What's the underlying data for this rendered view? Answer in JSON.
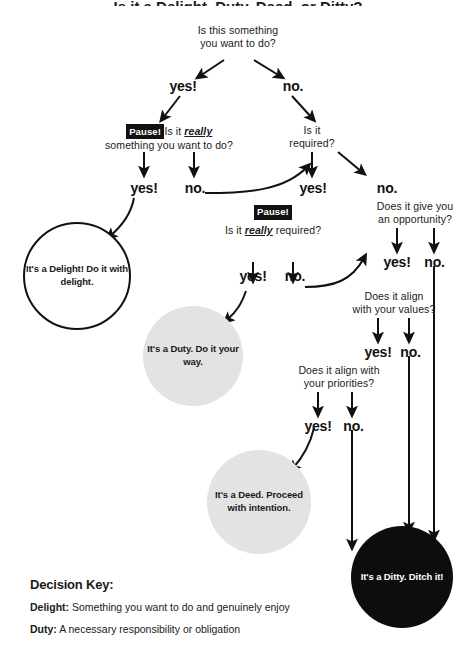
{
  "title_partial": "Is it a Delight, Duty, Deed, or Ditty?",
  "nodes": {
    "root_q": {
      "line1": "Is this something",
      "line2": "you want to do?"
    },
    "root_yes": "yes!",
    "root_no": "no.",
    "pause1_badge": "Pause!",
    "pause1_q_a": "Is it ",
    "pause1_q_em": "really",
    "pause1_line2": "something you want to do?",
    "l_yes": "yes!",
    "l_no": "no.",
    "required_q": {
      "line1": "Is it",
      "line2": "required?"
    },
    "req_yes": "yes!",
    "req_no": "no.",
    "pause2_badge": "Pause!",
    "pause2_q_a": "Is it ",
    "pause2_q_em": "really",
    "pause2_q_b": " required?",
    "m_yes": "yes!",
    "m_no": "no.",
    "opportunity_q": {
      "line1": "Does it give you",
      "line2": "an opportunity?"
    },
    "opp_yes": "yes!",
    "opp_no": "no.",
    "values_q": {
      "line1": "Does it align",
      "line2": "with your values?"
    },
    "val_yes": "yes!",
    "val_no": "no.",
    "priorities_q": {
      "line1": "Does it align with",
      "line2": "your priorities?"
    },
    "pri_yes": "yes!",
    "pri_no": "no."
  },
  "outcomes": {
    "delight": {
      "line1": "It's a Delight!",
      "line2": "Do it with",
      "line3": "delight."
    },
    "duty": {
      "line1": "It's a Duty.",
      "line2": "Do it",
      "line3": "your way."
    },
    "deed": {
      "line1": "It's a Deed.",
      "line2": "Proceed with",
      "line3": "intention."
    },
    "ditty": {
      "line1": "It's a Ditty.",
      "line2": "Ditch it!"
    }
  },
  "key": {
    "title": "Decision Key:",
    "rows": [
      {
        "term": "Delight:",
        "desc": " Something you want to do and genuinely enjoy"
      },
      {
        "term": "Duty:",
        "desc": " A necessary responsibility or obligation"
      }
    ]
  },
  "colors": {
    "ink": "#1a1a1a",
    "badge_bg": "#111111",
    "gray_circle": "#e3e3e3",
    "black_circle": "#0d0d0d",
    "page_bg": "#ffffff"
  }
}
